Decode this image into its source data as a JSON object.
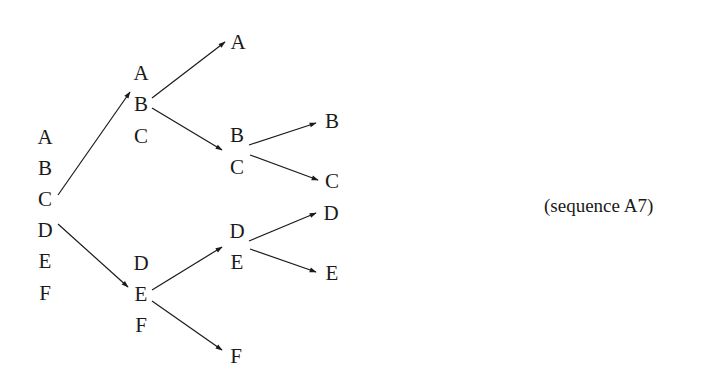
{
  "caption": "(sequence A7)",
  "nodes": [
    {
      "id": "root",
      "letters": [
        "A",
        "B",
        "C",
        "D",
        "E",
        "F"
      ],
      "x": 45,
      "y0": 136,
      "step": 31.2
    },
    {
      "id": "abc",
      "letters": [
        "A",
        "B",
        "C"
      ],
      "x": 141,
      "y0": 72,
      "step": 31.5
    },
    {
      "id": "def",
      "letters": [
        "D",
        "E",
        "F"
      ],
      "x": 141,
      "y0": 262,
      "step": 31
    },
    {
      "id": "bc",
      "letters": [
        "B",
        "C"
      ],
      "x": 237,
      "y0": 134,
      "step": 32
    },
    {
      "id": "de",
      "letters": [
        "D",
        "E"
      ],
      "x": 237,
      "y0": 230,
      "step": 31
    },
    {
      "id": "leafA",
      "letters": [
        "A"
      ],
      "x": 238,
      "y0": 41,
      "step": 0
    },
    {
      "id": "leafF",
      "letters": [
        "F"
      ],
      "x": 236,
      "y0": 355,
      "step": 0
    },
    {
      "id": "leafB",
      "letters": [
        "B"
      ],
      "x": 332,
      "y0": 120,
      "step": 0
    },
    {
      "id": "leafC",
      "letters": [
        "C"
      ],
      "x": 332,
      "y0": 180,
      "step": 0
    },
    {
      "id": "leafD",
      "letters": [
        "D"
      ],
      "x": 331,
      "y0": 212,
      "step": 0
    },
    {
      "id": "leafE",
      "letters": [
        "E"
      ],
      "x": 332,
      "y0": 272,
      "step": 0
    }
  ],
  "edges": [
    {
      "from": "root",
      "to": "abc",
      "x1": 58,
      "y1": 195,
      "x2": 130,
      "y2": 92
    },
    {
      "from": "root",
      "to": "def",
      "x1": 58,
      "y1": 224,
      "x2": 128,
      "y2": 287
    },
    {
      "from": "abc",
      "to": "leafA",
      "x1": 152,
      "y1": 98,
      "x2": 225,
      "y2": 42
    },
    {
      "from": "abc",
      "to": "bc",
      "x1": 152,
      "y1": 108,
      "x2": 222,
      "y2": 150
    },
    {
      "from": "def",
      "to": "de",
      "x1": 152,
      "y1": 290,
      "x2": 222,
      "y2": 247
    },
    {
      "from": "def",
      "to": "leafF",
      "x1": 152,
      "y1": 301,
      "x2": 222,
      "y2": 350
    },
    {
      "from": "bc",
      "to": "leafB",
      "x1": 249,
      "y1": 145,
      "x2": 316,
      "y2": 123
    },
    {
      "from": "bc",
      "to": "leafC",
      "x1": 250,
      "y1": 155,
      "x2": 318,
      "y2": 180
    },
    {
      "from": "de",
      "to": "leafD",
      "x1": 249,
      "y1": 241,
      "x2": 316,
      "y2": 213
    },
    {
      "from": "de",
      "to": "leafE",
      "x1": 250,
      "y1": 249,
      "x2": 316,
      "y2": 272
    }
  ]
}
